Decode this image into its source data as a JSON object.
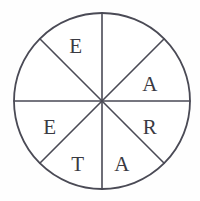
{
  "figure": {
    "name": "lettered-circle-wheel",
    "shape": "circle",
    "sector_count": 8,
    "background_color": "#fefefe",
    "line_color": "#4a4a55",
    "label_color": "#3a3a42",
    "geometry": {
      "center_x": 102,
      "center_y": 101,
      "radius": 88,
      "divider_angles_deg": [
        0,
        45,
        90,
        135,
        180,
        225,
        270,
        315
      ]
    },
    "dividers": [
      {
        "id": "vertical-diameter",
        "label": "vertical diameter"
      },
      {
        "id": "horizontal-diameter",
        "label": "horizontal diameter"
      },
      {
        "id": "diagonal-nw-se",
        "label": "diagonal northwest to southeast"
      },
      {
        "id": "diagonal-ne-sw",
        "label": "diagonal northeast to southwest"
      }
    ],
    "sectors": [
      {
        "index": 0,
        "position": "top-right",
        "label": "",
        "label_x": 131,
        "label_y": 47
      },
      {
        "index": 1,
        "position": "right-upper",
        "label": "A",
        "label_x": 150,
        "label_y": 84
      },
      {
        "index": 2,
        "position": "right-lower",
        "label": "R",
        "label_x": 150,
        "label_y": 127
      },
      {
        "index": 3,
        "position": "bottom-right",
        "label": "A",
        "label_x": 122,
        "label_y": 164
      },
      {
        "index": 4,
        "position": "bottom-left",
        "label": "T",
        "label_x": 78,
        "label_y": 164
      },
      {
        "index": 5,
        "position": "left-lower",
        "label": "E",
        "label_x": 50,
        "label_y": 127
      },
      {
        "index": 6,
        "position": "left-upper",
        "label": "",
        "label_x": 50,
        "label_y": 76
      },
      {
        "index": 7,
        "position": "top-left",
        "label": "E",
        "label_x": 76,
        "label_y": 46
      }
    ],
    "letters_clockwise_from_top": [
      "",
      "A",
      "R",
      "A",
      "T",
      "E",
      "",
      "E"
    ]
  }
}
